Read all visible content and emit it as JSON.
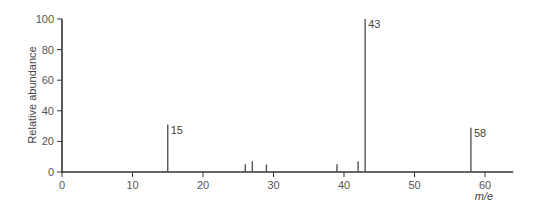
{
  "chart_data": {
    "type": "bar",
    "subtype": "mass-spectrum-stick",
    "title": "",
    "xlabel": "m/e",
    "ylabel": "Relative abundance",
    "xlim": [
      0,
      64
    ],
    "ylim": [
      0,
      100
    ],
    "xticks": [
      0,
      10,
      20,
      30,
      40,
      50,
      60
    ],
    "yticks": [
      0,
      20,
      40,
      60,
      80,
      100
    ],
    "grid": false,
    "legend": null,
    "peaks": [
      {
        "x": 15,
        "y": 31,
        "label": "15"
      },
      {
        "x": 26,
        "y": 5,
        "label": ""
      },
      {
        "x": 27,
        "y": 7,
        "label": ""
      },
      {
        "x": 29,
        "y": 5,
        "label": ""
      },
      {
        "x": 39,
        "y": 5,
        "label": ""
      },
      {
        "x": 42,
        "y": 7,
        "label": ""
      },
      {
        "x": 43,
        "y": 100,
        "label": "43"
      },
      {
        "x": 58,
        "y": 29,
        "label": "58"
      }
    ],
    "categories": [
      15,
      26,
      27,
      29,
      39,
      42,
      43,
      58
    ],
    "values": [
      31,
      5,
      7,
      5,
      5,
      7,
      100,
      29
    ],
    "annotations": [
      "15",
      "43",
      "58"
    ]
  },
  "colors": {
    "axis": "#333333",
    "peak": "#555555",
    "text": "#555555"
  }
}
